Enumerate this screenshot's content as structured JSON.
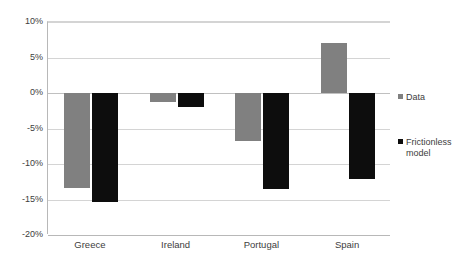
{
  "chart_data": {
    "type": "bar",
    "title": "",
    "subtitle": "",
    "xlabel": "",
    "ylabel": "",
    "categories": [
      "Greece",
      "Ireland",
      "Portugal",
      "Spain"
    ],
    "series": [
      {
        "name": "Data",
        "color": "#808080",
        "values": [
          -13.4,
          -1.2,
          -6.8,
          7.0
        ]
      },
      {
        "name": "Frictionless model",
        "color": "#0d0d0d",
        "values": [
          -15.3,
          -2.0,
          -13.5,
          -12.1
        ]
      }
    ],
    "ylim": [
      -20,
      10
    ],
    "ytick_values": [
      10,
      5,
      0,
      -5,
      -10,
      -15,
      -20
    ],
    "ytick_labels": [
      "10%",
      "5%",
      "0%",
      "-5%",
      "-10%",
      "-15%",
      "-20%"
    ],
    "grid": true,
    "legend_position": "right",
    "legend": [
      {
        "label": "Data",
        "color": "#808080"
      },
      {
        "label": "Frictionless model",
        "color": "#0d0d0d"
      }
    ],
    "colors": {
      "background": "#ffffff",
      "gridline": "#d4d4d4",
      "axis": "#b8b8b8",
      "text": "#3d3d3d"
    }
  }
}
